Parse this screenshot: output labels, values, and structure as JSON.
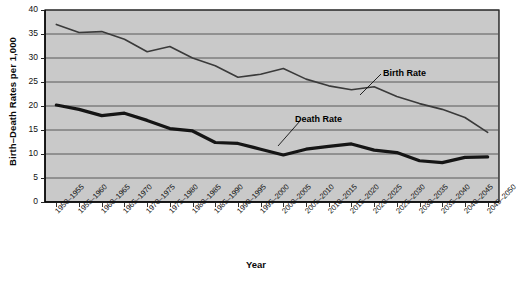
{
  "chart_data": {
    "type": "line",
    "title": "",
    "xlabel": "Year",
    "ylabel": "Birth–Death Rates per 1,000",
    "ylim": [
      0,
      40
    ],
    "yticks": [
      0,
      5,
      10,
      15,
      20,
      25,
      30,
      35,
      40
    ],
    "grid": true,
    "legend_position": "inline-annotation",
    "categories": [
      "1950–1955",
      "1955–1960",
      "1960–1965",
      "1965–1970",
      "1970–1975",
      "1975–1980",
      "1980–1985",
      "1985–1990",
      "1990–1995",
      "1995–2000",
      "2000–2005",
      "2005–2010",
      "2010–2015",
      "2015–2020",
      "2020–2025",
      "2025–2030",
      "2030–2035",
      "2035–2040",
      "2040–2045",
      "2045–2050"
    ],
    "series": [
      {
        "name": "Birth Rate",
        "color": "#3a3a3a",
        "width": 1.6,
        "values": [
          37.0,
          35.3,
          35.5,
          33.9,
          31.3,
          32.4,
          30.0,
          28.4,
          26.0,
          26.6,
          27.8,
          25.6,
          24.2,
          23.4,
          24.0,
          22.0,
          20.5,
          19.3,
          17.6,
          14.5
        ]
      },
      {
        "name": "Death Rate",
        "color": "#151515",
        "width": 3.2,
        "values": [
          20.2,
          19.3,
          18.0,
          18.5,
          17.0,
          15.3,
          14.8,
          12.4,
          12.2,
          11.0,
          9.8,
          11.0,
          11.6,
          12.1,
          10.8,
          10.3,
          8.6,
          8.2,
          9.3,
          9.4
        ]
      }
    ],
    "annotations": [
      {
        "text": "Birth Rate",
        "x": 383,
        "y": 68
      },
      {
        "text": "Death Rate",
        "x": 295,
        "y": 114
      }
    ]
  },
  "axes": {
    "x_title": "Year",
    "y_title": "Birth–Death Rates per 1,000"
  }
}
